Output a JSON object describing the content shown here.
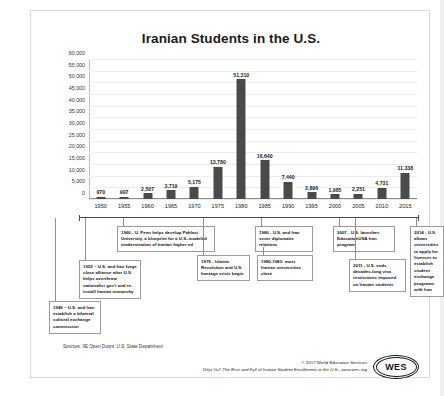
{
  "chart_data": {
    "type": "bar",
    "title": "Iranian Students in the U.S.",
    "xlabel": "",
    "ylabel": "",
    "ylim": [
      0,
      60000
    ],
    "ytick_step": 5000,
    "grid": true,
    "legend": "none",
    "categories": [
      "1950",
      "1955",
      "1960",
      "1965",
      "1970",
      "1975",
      "1980",
      "1985",
      "1990",
      "1995",
      "2000",
      "2005",
      "2010",
      "2015"
    ],
    "values": [
      970,
      997,
      2507,
      3719,
      5175,
      13780,
      51310,
      16640,
      7440,
      2896,
      1985,
      2251,
      4731,
      11338
    ],
    "value_labels": [
      "970",
      "997",
      "2,507",
      "3,719",
      "5,175",
      "13,780",
      "51,310",
      "16,640",
      "7,440",
      "2,896",
      "1,985",
      "2,251",
      "4,731",
      "11,338"
    ],
    "ytick_labels": [
      "60,000",
      "55,000",
      "50,000",
      "45,000",
      "40,000",
      "35,000",
      "30,000",
      "25,000",
      "20,000",
      "15,000",
      "10,000",
      "5,000",
      "0"
    ],
    "bar_color": "#4a4a4a",
    "annotations": [
      "1949 – U.S. and Iran establish a bilateral cultural exchange commission",
      "1953 – U.S. and Iran forge close alliance after U.S. helps overthrow nationalist gov't and re-install Iranian monarchy",
      "1960 - U. Penn helps develop Pahlavi University, a blueprint for a U.S.-modeled modernization of Iranian higher ed",
      "1979 - Islamic Revolution and U.S. hostage crisis begin",
      "1980 - U.S. and Iran sever diplomatic relations",
      "1980-1983: most Iranian universities close",
      "2007 - U.S. launches EducationUSA Iran program",
      "2011 - U.S. ends decades-long visa restrictions imposed on Iranian students",
      "2014 - U.S. allows universities to apply for licenses to establish student exchange programs with Iran"
    ]
  },
  "footer": {
    "sources": "Sources: IIE Open Doors; U.S. State Department",
    "credit_line1": "© 2017 World Education Services",
    "credit_line2": "Déjà Vu? The Rise and Fall of Iranian Student Enrollments in the U.S., www.wes.org",
    "logo_text": "WES"
  }
}
